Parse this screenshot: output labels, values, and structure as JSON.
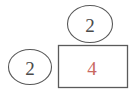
{
  "diagram": {
    "type": "part-whole-bar-model",
    "background_color": "#ffffff",
    "stroke_color": "#595959",
    "nodes": [
      {
        "id": "top-ellipse",
        "shape": "ellipse",
        "label": "2",
        "text_color": "#4a4a4a",
        "cx": 90,
        "cy": 24,
        "rx": 23,
        "ry": 19
      },
      {
        "id": "left-ellipse",
        "shape": "ellipse",
        "label": "2",
        "text_color": "#4a4a4a",
        "cx": 30,
        "cy": 67,
        "rx": 22,
        "ry": 18
      },
      {
        "id": "main-rectangle",
        "shape": "rectangle",
        "label": "4",
        "text_color": "#c9685f",
        "x": 58,
        "y": 45,
        "width": 70,
        "height": 43
      }
    ]
  }
}
